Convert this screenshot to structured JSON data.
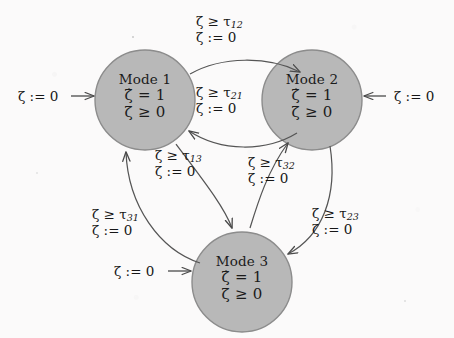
{
  "diagram": {
    "type": "state-transition-diagram",
    "background_color": "#fbfafa",
    "node_fill_color": "#b8b8b8",
    "node_stroke_color": "#8e8e8e",
    "edge_color": "#555555",
    "text_color": "#161616"
  },
  "nodes": [
    {
      "id": "mode1",
      "title": "Mode 1",
      "invariant_rate": "ζ̇ = 1",
      "invariant_bound": "ζ ≥ 0",
      "cx": 145,
      "cy": 100,
      "r": 50
    },
    {
      "id": "mode2",
      "title": "Mode 2",
      "invariant_rate": "ζ̇ = 1",
      "invariant_bound": "ζ ≥ 0",
      "cx": 312,
      "cy": 100,
      "r": 50
    },
    {
      "id": "mode3",
      "title": "Mode 3",
      "invariant_rate": "ζ̇ = 1",
      "invariant_bound": "ζ ≥ 0",
      "cx": 242,
      "cy": 282,
      "r": 50
    }
  ],
  "transitions": [
    {
      "id": "t12",
      "from": "mode1",
      "to": "mode2",
      "guard_prefix": "ζ ≥ τ",
      "guard_sub": "12",
      "reset": "ζ := 0"
    },
    {
      "id": "t21",
      "from": "mode2",
      "to": "mode1",
      "guard_prefix": "ζ ≥ τ",
      "guard_sub": "21",
      "reset": "ζ := 0"
    },
    {
      "id": "t13",
      "from": "mode1",
      "to": "mode3",
      "guard_prefix": "ζ ≥ τ",
      "guard_sub": "13",
      "reset": "ζ := 0"
    },
    {
      "id": "t31",
      "from": "mode3",
      "to": "mode1",
      "guard_prefix": "ζ ≥ τ",
      "guard_sub": "31",
      "reset": "ζ := 0"
    },
    {
      "id": "t32",
      "from": "mode3",
      "to": "mode2",
      "guard_prefix": "ζ ≥ τ",
      "guard_sub": "32",
      "reset": "ζ := 0"
    },
    {
      "id": "t23",
      "from": "mode2",
      "to": "mode3",
      "guard_prefix": "ζ ≥ τ",
      "guard_sub": "23",
      "reset": "ζ := 0"
    }
  ],
  "entries": [
    {
      "id": "entry1",
      "target": "mode1",
      "label": "ζ := 0",
      "arrow": "→",
      "direction": "left-to-right"
    },
    {
      "id": "entry2",
      "target": "mode2",
      "label": "ζ := 0",
      "arrow": "←",
      "direction": "right-to-left"
    },
    {
      "id": "entry3",
      "target": "mode3",
      "label": "ζ := 0",
      "arrow": "→",
      "direction": "left-to-right"
    }
  ]
}
